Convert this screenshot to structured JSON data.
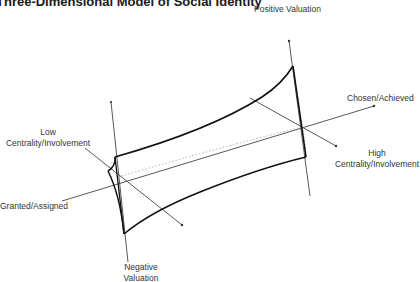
{
  "title": "Three-Dimensional Model of Social Identity",
  "axes": {
    "valuation": {
      "positive_label": "Positive Valuation",
      "negative_label_line1": "Negative",
      "negative_label_line2": "Valuation"
    },
    "origin": {
      "granted_label": "Granted/Assigned",
      "chosen_label": "Chosen/Achieved"
    },
    "centrality": {
      "low_label_line1": "Low",
      "low_label_line2": "Centrality/Involvement",
      "high_label_line1": "High",
      "high_label_line2": "Centrality/Involvement"
    }
  },
  "colors": {
    "line": "#222222",
    "dotted": "#999999",
    "text": "#333333"
  }
}
